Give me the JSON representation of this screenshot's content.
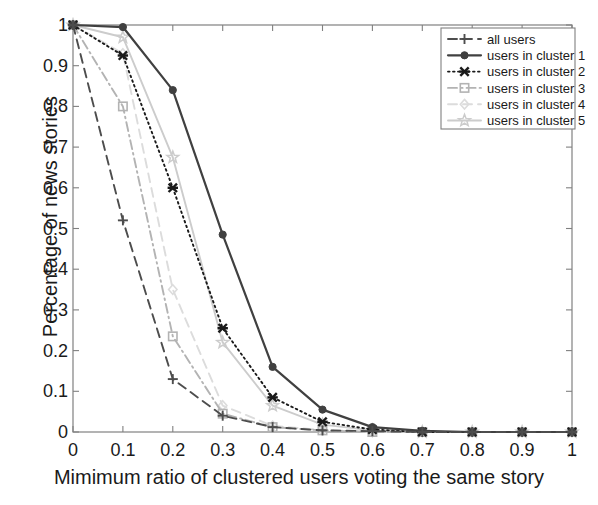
{
  "chart_data": {
    "type": "line",
    "title": "",
    "xlabel": "Mimimum ratio of clustered users voting the same story",
    "ylabel": "Percentage of news stories",
    "xlim": [
      0,
      1
    ],
    "ylim": [
      0,
      1
    ],
    "grid": false,
    "legend_position": "top-right",
    "xticks": [
      "0",
      "0.1",
      "0.2",
      "0.3",
      "0.4",
      "0.5",
      "0.6",
      "0.7",
      "0.8",
      "0.9",
      "1"
    ],
    "yticks": [
      "0",
      "0.1",
      "0.2",
      "0.3",
      "0.4",
      "0.5",
      "0.6",
      "0.7",
      "0.8",
      "0.9",
      "1"
    ],
    "x": [
      0,
      0.1,
      0.2,
      0.3,
      0.4,
      0.5,
      0.6,
      0.7,
      0.8,
      0.9,
      1
    ],
    "series": [
      {
        "name": "all users",
        "marker": "plus",
        "dash": "dashed",
        "color": "#4d4d4d",
        "values": [
          1.0,
          0.52,
          0.13,
          0.04,
          0.012,
          0.004,
          0.002,
          0.0,
          0.0,
          0.0,
          0.0
        ]
      },
      {
        "name": "users in cluster 1",
        "marker": "circle",
        "dash": "solid",
        "color": "#404040",
        "values": [
          1.0,
          0.995,
          0.84,
          0.485,
          0.16,
          0.055,
          0.012,
          0.003,
          0.0,
          0.0,
          0.0
        ]
      },
      {
        "name": "users in cluster 2",
        "marker": "xmark",
        "dash": "dotted",
        "color": "#1a1a1a",
        "values": [
          1.0,
          0.925,
          0.6,
          0.255,
          0.085,
          0.025,
          0.006,
          0.0,
          0.0,
          0.0,
          0.0
        ]
      },
      {
        "name": "users in cluster 3",
        "marker": "square",
        "dash": "dashdot",
        "color": "#b3b3b3",
        "values": [
          1.0,
          0.8,
          0.235,
          0.045,
          0.012,
          0.004,
          0.0,
          0.0,
          0.0,
          0.0,
          0.0
        ]
      },
      {
        "name": "users in cluster 4",
        "marker": "diamond",
        "dash": "dashed",
        "color": "#dcdcdc",
        "values": [
          1.0,
          0.93,
          0.35,
          0.065,
          0.015,
          0.005,
          0.0,
          0.0,
          0.0,
          0.0,
          0.0
        ]
      },
      {
        "name": "users in cluster 5",
        "marker": "star",
        "dash": "solid",
        "color": "#cccccc",
        "values": [
          1.0,
          0.97,
          0.675,
          0.22,
          0.065,
          0.018,
          0.004,
          0.0,
          0.0,
          0.0,
          0.0
        ]
      }
    ]
  }
}
